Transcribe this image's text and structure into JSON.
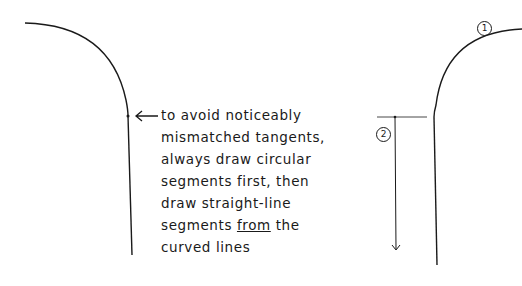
{
  "diagram": {
    "note_lines": [
      "to avoid noticeably",
      "mismatched tangents,",
      "always draw circular",
      "segments first, then",
      "draw straight-line",
      "segments ",
      "from",
      " the",
      "curved lines"
    ],
    "label_1": "1",
    "label_2": "2",
    "stroke_color": "#1a1a1a",
    "background": "#ffffff"
  }
}
